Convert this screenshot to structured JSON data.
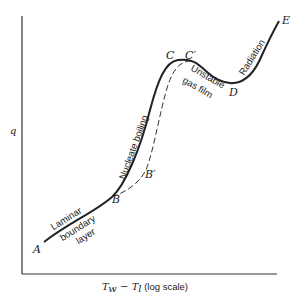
{
  "diagram": {
    "axes": {
      "y_label": "q",
      "x_label_main": "T",
      "x_label_sub_w": "w",
      "x_label_minus": " − ",
      "x_label_main2": "T",
      "x_label_sub_l": "l",
      "x_label_note": " (log scale)"
    },
    "points": {
      "A": "A",
      "B": "B",
      "B_prime": "B′",
      "C": "C",
      "C_prime": "C′",
      "D": "D",
      "E": "E"
    },
    "regions": {
      "laminar_line1": "Laminar",
      "laminar_line2": "boundary",
      "laminar_line3": "layer",
      "nucleate": "Nucleate boiling",
      "unstable_line1": "Unstable",
      "unstable_line2": "gas film",
      "radiation": "Radiation"
    },
    "colors": {
      "ink": "#222222",
      "background": "#ffffff"
    }
  }
}
